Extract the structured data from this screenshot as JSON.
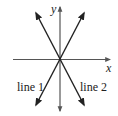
{
  "diagram": {
    "axes": {
      "x_label": "x",
      "y_label": "y",
      "color": "#555555"
    },
    "lines": [
      {
        "name": "line 1",
        "label": "line 1",
        "slope_sign": "positive",
        "color": "#222222"
      },
      {
        "name": "line 2",
        "label": "line 2",
        "slope_sign": "negative",
        "color": "#222222"
      }
    ]
  }
}
